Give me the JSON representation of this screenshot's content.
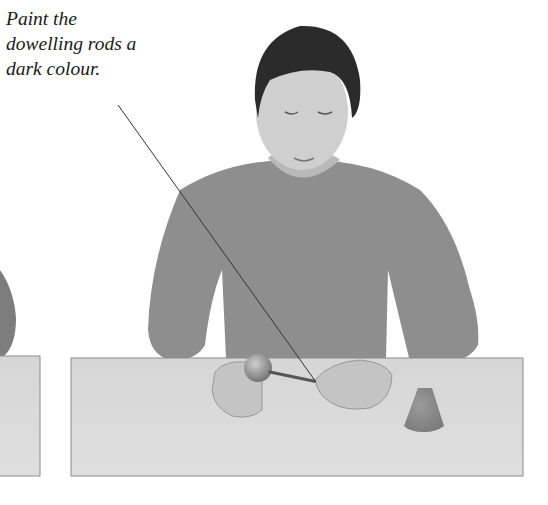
{
  "caption": {
    "lines": [
      "Paint the",
      "dowelling rods a",
      "dark colour."
    ]
  },
  "illustration": {
    "subject": "girl seated at table painting dowelling rod",
    "objects": [
      "wooden ball on rod",
      "dowelling rod",
      "cone"
    ]
  },
  "colors": {
    "background": "#ffffff",
    "table_top": "#d9d9d9",
    "table_edge": "#8a8a8a",
    "sweater": "#8c8c8c",
    "hair": "#2a2a2a",
    "skin": "#c9c9c9",
    "leader_line": "#333333"
  }
}
